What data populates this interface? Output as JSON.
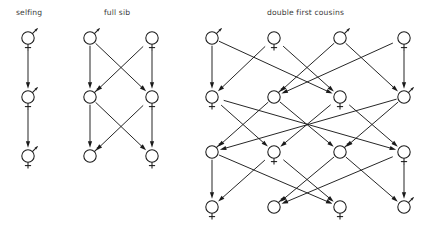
{
  "figure": {
    "width": 428,
    "height": 234,
    "background": "#ffffff",
    "ink_color": "#1a1a1a",
    "title_color": "#3a3a3a"
  },
  "panels": [
    {
      "id": "selfing",
      "title": "selfing",
      "title_x": 16,
      "title_y": 15,
      "mating_system": "selfing",
      "generations": 3,
      "individuals_per_generation": 1,
      "sex_symbol": "hermaphrodite",
      "nodes": [
        {
          "id": "s1",
          "x": 28,
          "y": 38,
          "sex": "hermaphrodite",
          "generation": 1
        },
        {
          "id": "s2",
          "x": 28,
          "y": 97,
          "sex": "hermaphrodite",
          "generation": 2
        },
        {
          "id": "s3",
          "x": 28,
          "y": 156,
          "sex": "hermaphrodite",
          "generation": 3
        }
      ],
      "edges": [
        {
          "from": "s1",
          "to": "s2"
        },
        {
          "from": "s2",
          "to": "s3"
        }
      ]
    },
    {
      "id": "full-sib",
      "title": "full sib",
      "title_x": 104,
      "title_y": 15,
      "mating_system": "full sib",
      "generations": 3,
      "individuals_per_generation": 2,
      "nodes": [
        {
          "id": "f1",
          "x": 90,
          "y": 38,
          "sex": "male",
          "generation": 1
        },
        {
          "id": "f2",
          "x": 152,
          "y": 38,
          "sex": "female",
          "generation": 1
        },
        {
          "id": "f3",
          "x": 90,
          "y": 97,
          "sex": "male",
          "generation": 2
        },
        {
          "id": "f4",
          "x": 152,
          "y": 97,
          "sex": "female",
          "generation": 2
        },
        {
          "id": "f5",
          "x": 90,
          "y": 156,
          "sex": "male",
          "generation": 3
        },
        {
          "id": "f6",
          "x": 152,
          "y": 156,
          "sex": "female",
          "generation": 3
        }
      ],
      "edges": [
        {
          "from": "f1",
          "to": "f3"
        },
        {
          "from": "f1",
          "to": "f4"
        },
        {
          "from": "f2",
          "to": "f3"
        },
        {
          "from": "f2",
          "to": "f4"
        },
        {
          "from": "f3",
          "to": "f5"
        },
        {
          "from": "f3",
          "to": "f6"
        },
        {
          "from": "f4",
          "to": "f5"
        },
        {
          "from": "f4",
          "to": "f6"
        }
      ]
    },
    {
      "id": "double-first-cousins",
      "title": "double first cousins",
      "title_x": 267,
      "title_y": 15,
      "mating_system": "double first cousins",
      "generations": 4,
      "individuals_per_generation": 4,
      "nodes": [
        {
          "id": "c11",
          "x": 212,
          "y": 38,
          "sex": "male",
          "generation": 1
        },
        {
          "id": "c12",
          "x": 274,
          "y": 38,
          "sex": "female",
          "generation": 1
        },
        {
          "id": "c13",
          "x": 340,
          "y": 38,
          "sex": "male",
          "generation": 1
        },
        {
          "id": "c14",
          "x": 404,
          "y": 38,
          "sex": "female",
          "generation": 1
        },
        {
          "id": "c21",
          "x": 212,
          "y": 97,
          "sex": "female",
          "generation": 2
        },
        {
          "id": "c22",
          "x": 274,
          "y": 97,
          "sex": "male",
          "generation": 2
        },
        {
          "id": "c23",
          "x": 340,
          "y": 97,
          "sex": "female",
          "generation": 2
        },
        {
          "id": "c24",
          "x": 404,
          "y": 97,
          "sex": "male",
          "generation": 2
        },
        {
          "id": "c31",
          "x": 212,
          "y": 152,
          "sex": "male",
          "generation": 3
        },
        {
          "id": "c32",
          "x": 274,
          "y": 152,
          "sex": "female",
          "generation": 3
        },
        {
          "id": "c33",
          "x": 340,
          "y": 152,
          "sex": "male",
          "generation": 3
        },
        {
          "id": "c34",
          "x": 404,
          "y": 152,
          "sex": "female",
          "generation": 3
        },
        {
          "id": "c41",
          "x": 212,
          "y": 207,
          "sex": "female",
          "generation": 4
        },
        {
          "id": "c42",
          "x": 274,
          "y": 207,
          "sex": "male",
          "generation": 4
        },
        {
          "id": "c43",
          "x": 340,
          "y": 207,
          "sex": "female",
          "generation": 4
        },
        {
          "id": "c44",
          "x": 404,
          "y": 207,
          "sex": "male",
          "generation": 4
        }
      ],
      "edges": [
        {
          "from": "c11",
          "to": "c21"
        },
        {
          "from": "c11",
          "to": "c23"
        },
        {
          "from": "c12",
          "to": "c21"
        },
        {
          "from": "c12",
          "to": "c23"
        },
        {
          "from": "c13",
          "to": "c22"
        },
        {
          "from": "c13",
          "to": "c24"
        },
        {
          "from": "c14",
          "to": "c22"
        },
        {
          "from": "c14",
          "to": "c24"
        },
        {
          "from": "c21",
          "to": "c32"
        },
        {
          "from": "c21",
          "to": "c34"
        },
        {
          "from": "c22",
          "to": "c31"
        },
        {
          "from": "c22",
          "to": "c33"
        },
        {
          "from": "c23",
          "to": "c32"
        },
        {
          "from": "c23",
          "to": "c34"
        },
        {
          "from": "c24",
          "to": "c31"
        },
        {
          "from": "c24",
          "to": "c33"
        },
        {
          "from": "c31",
          "to": "c41"
        },
        {
          "from": "c31",
          "to": "c43"
        },
        {
          "from": "c32",
          "to": "c41"
        },
        {
          "from": "c32",
          "to": "c43"
        },
        {
          "from": "c33",
          "to": "c42"
        },
        {
          "from": "c33",
          "to": "c44"
        },
        {
          "from": "c34",
          "to": "c42"
        },
        {
          "from": "c34",
          "to": "c44"
        }
      ]
    }
  ],
  "symbols": {
    "male": "circle with arrow pointing up-right",
    "female": "circle with cross below",
    "hermaphrodite": "circle with arrow up-right and cross below"
  },
  "geometry": {
    "node_radius": 6.2,
    "arrowhead_length": 6.5,
    "arrowhead_width": 4.2
  }
}
